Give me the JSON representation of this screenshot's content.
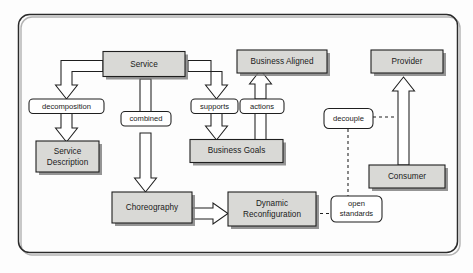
{
  "diagram": {
    "frame": {
      "shape": "rounded-rectangle"
    },
    "colors": {
      "node_fill": "#d9d9d6",
      "node_stroke": "#1f1f1f",
      "label_fill": "#ffffff",
      "shadow": "#7e7e7e",
      "background": "#fdfdfd"
    },
    "nodes": [
      {
        "id": "service",
        "label": "Service",
        "kind": "entity"
      },
      {
        "id": "business-aligned",
        "label": "Business Aligned",
        "kind": "entity"
      },
      {
        "id": "provider",
        "label": "Provider",
        "kind": "entity"
      },
      {
        "id": "service-description",
        "label": "Service\nDescription",
        "line1": "Service",
        "line2": "Description",
        "kind": "entity"
      },
      {
        "id": "business-goals",
        "label": "Business Goals",
        "kind": "entity"
      },
      {
        "id": "consumer",
        "label": "Consumer",
        "kind": "entity"
      },
      {
        "id": "choreography",
        "label": "Choreography",
        "kind": "entity"
      },
      {
        "id": "dynamic-reconfiguration",
        "label": "Dynamic\nReconfiguration",
        "line1": "Dynamic",
        "line2": "Reconfiguration",
        "kind": "entity"
      }
    ],
    "edge_labels": [
      {
        "id": "decomposition",
        "label": "decomposition"
      },
      {
        "id": "combined",
        "label": "combined"
      },
      {
        "id": "supports",
        "label": "supports"
      },
      {
        "id": "actions",
        "label": "actions"
      },
      {
        "id": "decouple",
        "label": "decouple"
      },
      {
        "id": "open-standards",
        "label": "open\nstandards",
        "line1": "open",
        "line2": "standards"
      }
    ],
    "edges": [
      {
        "from": "service",
        "to": "service-description",
        "via": "decomposition",
        "style": "block-arrow"
      },
      {
        "from": "service",
        "to": "choreography",
        "via": "combined",
        "style": "block-arrow"
      },
      {
        "from": "service",
        "to": "business-goals",
        "via": "supports",
        "style": "block-arrow"
      },
      {
        "from": "business-goals",
        "to": "business-aligned",
        "via": "actions",
        "style": "block-arrow"
      },
      {
        "from": "choreography",
        "to": "dynamic-reconfiguration",
        "via": null,
        "style": "block-arrow"
      },
      {
        "from": "consumer",
        "to": "provider",
        "via": "decouple",
        "style": "block-arrow"
      },
      {
        "from": "decouple",
        "to": "consumer-provider-link",
        "style": "dashed"
      },
      {
        "from": "decouple",
        "to": "open-standards",
        "style": "dashed"
      },
      {
        "from": "open-standards",
        "to": "dynamic-reconfiguration",
        "style": "dashed"
      }
    ]
  }
}
